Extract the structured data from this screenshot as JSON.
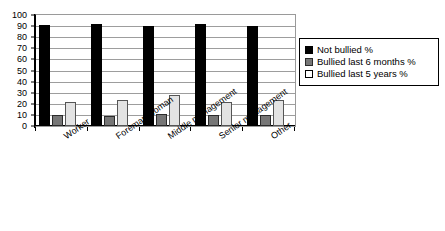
{
  "chart_data": {
    "type": "bar",
    "title": "",
    "subtitle": "",
    "xlabel": "",
    "ylabel": "",
    "ylim": [
      0,
      100
    ],
    "ytick_step": 10,
    "yticks": [
      "100",
      "90",
      "80",
      "70",
      "60",
      "50",
      "40",
      "30",
      "20",
      "10",
      "0"
    ],
    "grid": true,
    "legend_position": "right",
    "categories": [
      "Worker",
      "Foreman/woman",
      "Middle management",
      "Senior management",
      "Other"
    ],
    "series": [
      {
        "name": "Not bullied %",
        "color": "#000000",
        "values": [
          91,
          92,
          90,
          92,
          90
        ]
      },
      {
        "name": "Bullied last 6 months %",
        "color": "#767676",
        "values": [
          10,
          9,
          11,
          10,
          10
        ]
      },
      {
        "name": "Bullied last 5 years %",
        "color": "#e3e3e3",
        "values": [
          22,
          23,
          28,
          22,
          23
        ]
      }
    ]
  },
  "legend": {
    "items": [
      {
        "label": "Not bullied %",
        "swatch": "black-square-swatch"
      },
      {
        "label": "Bullied last 6 months %",
        "swatch": "gray-square-swatch"
      },
      {
        "label": "Bullied last 5 years %",
        "swatch": "white-square-swatch"
      }
    ]
  }
}
